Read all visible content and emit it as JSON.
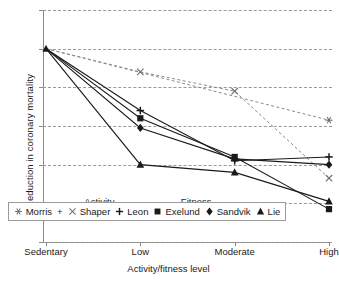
{
  "chart_data": {
    "type": "line",
    "title": "",
    "xlabel": "Activity/fitness level",
    "ylabel": "Reduction in coronary mortality",
    "categories": [
      "Sedentary",
      "Low",
      "Moderate",
      "High"
    ],
    "ylim": [
      0,
      120
    ],
    "yticks": [
      0,
      20,
      40,
      60,
      80,
      100,
      120
    ],
    "grid": true,
    "legend_position": "inside-bottom-center",
    "series": [
      {
        "name": "Morris",
        "marker": "asterisk",
        "line": "dashed",
        "values": [
          100,
          null,
          null,
          63
        ]
      },
      {
        "name": "Shaper",
        "marker": "x",
        "line": "dashed",
        "values": [
          100,
          88,
          78,
          33
        ]
      },
      {
        "name": "Leon",
        "marker": "plus",
        "line": "solid",
        "values": [
          100,
          68,
          42,
          44
        ]
      },
      {
        "name": "Exelund",
        "marker": "square",
        "line": "solid",
        "values": [
          100,
          64,
          44,
          17
        ]
      },
      {
        "name": "Sandvik",
        "marker": "diamond",
        "line": "solid",
        "values": [
          100,
          59,
          43,
          40
        ]
      },
      {
        "name": "Lie",
        "marker": "triangle",
        "line": "solid",
        "values": [
          100,
          40,
          36,
          21
        ]
      }
    ],
    "annotations": [
      {
        "text": "Activity",
        "x_category_fraction": 0.195,
        "y": 21
      },
      {
        "text": "Fitness",
        "x_category_fraction": 0.53,
        "y": 21
      }
    ],
    "legend": [
      {
        "label": "Morris",
        "marker": "asterisk"
      },
      {
        "label": "Shaper",
        "marker": "x"
      },
      {
        "label": "Leon",
        "marker": "plus"
      },
      {
        "label": "Exelund",
        "marker": "square"
      },
      {
        "label": "Sandvik",
        "marker": "diamond"
      },
      {
        "label": "Lie",
        "marker": "triangle"
      }
    ],
    "legend_joiner": "+",
    "colors": {
      "line": "#1a1a1a",
      "dashed_line": "#8c8c8c",
      "grid": "#9a9a9a",
      "axis": "#8a8a8a",
      "text": "#1a1a1a",
      "background": "#ffffff"
    }
  }
}
